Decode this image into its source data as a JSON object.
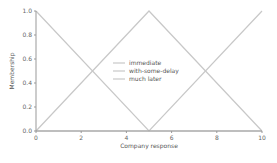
{
  "chart_data": {
    "type": "line",
    "title": "",
    "xlabel": "Company response",
    "ylabel": "Membership",
    "xlim": [
      0,
      10
    ],
    "ylim": [
      0,
      1
    ],
    "grid": false,
    "legend_position": "center",
    "x_ticks": [
      "0",
      "2",
      "4",
      "6",
      "8",
      "10"
    ],
    "y_ticks": [
      "0.0",
      "0.2",
      "0.4",
      "0.6",
      "0.8",
      "1.0"
    ],
    "series": [
      {
        "name": "immediate",
        "x": [
          0,
          5,
          10
        ],
        "y": [
          1.0,
          0.0,
          0.0
        ],
        "color": "#c8c8c8"
      },
      {
        "name": "with-some-delay",
        "x": [
          0,
          5,
          10
        ],
        "y": [
          0.0,
          1.0,
          0.0
        ],
        "color": "#c8c8c8"
      },
      {
        "name": "much later",
        "x": [
          0,
          5,
          10
        ],
        "y": [
          0.0,
          0.0,
          1.0
        ],
        "color": "#c8c8c8"
      }
    ]
  },
  "colors": {
    "axis": "#999999",
    "line": "#c8c8c8",
    "text": "#666666"
  }
}
